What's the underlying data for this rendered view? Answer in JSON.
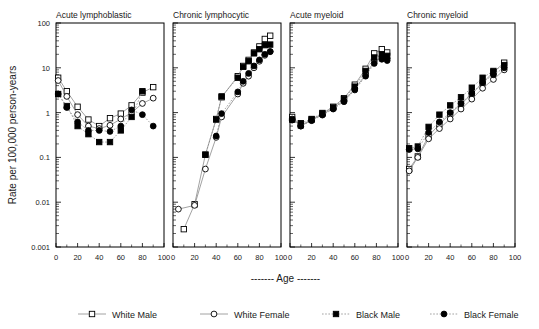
{
  "figure": {
    "ylabel": "Rate per 100,000 person-years",
    "xlabel": "Age",
    "xlabel_prefix": "-------",
    "xlabel_suffix": "-------"
  },
  "legend": {
    "items": [
      {
        "label": "White Male",
        "marker": "open-square",
        "line": "solid",
        "color": "#000000"
      },
      {
        "label": "White Female",
        "marker": "open-circle",
        "line": "solid",
        "color": "#000000"
      },
      {
        "label": "Black Male",
        "marker": "filled-square",
        "line": "dotted",
        "color": "#000000"
      },
      {
        "label": "Black Female",
        "marker": "filled-circle",
        "line": "dotted",
        "color": "#000000"
      }
    ]
  },
  "axes": {
    "y_ticks": [
      "100",
      "10",
      "1",
      "0.1",
      "0.01",
      "0.001"
    ],
    "y_values": [
      100,
      10,
      1,
      0.1,
      0.01,
      0.001
    ],
    "x_ticks": [
      "0",
      "20",
      "40",
      "60",
      "80",
      "100"
    ],
    "x_values": [
      0,
      20,
      40,
      60,
      80,
      100
    ],
    "ylim": [
      0.001,
      100
    ],
    "xlim": [
      0,
      100
    ],
    "yscale": "log"
  },
  "chart_data": [
    {
      "type": "line",
      "title": "Acute lymphoblastic",
      "xlabel": "Age",
      "ylabel": "Rate per 100,000 person-years",
      "yscale": "log",
      "ylim": [
        0.001,
        100
      ],
      "xlim": [
        0,
        100
      ],
      "x": [
        2,
        10,
        20,
        30,
        40,
        50,
        60,
        70,
        80,
        90
      ],
      "series": [
        {
          "name": "White Male",
          "marker": "open-square",
          "line": "solid",
          "values": [
            6.0,
            3.0,
            1.35,
            0.7,
            0.5,
            0.75,
            0.95,
            1.45,
            2.8,
            3.7
          ]
        },
        {
          "name": "White Female",
          "marker": "open-circle",
          "line": "solid",
          "values": [
            5.2,
            2.3,
            0.9,
            0.5,
            0.44,
            0.52,
            0.72,
            1.0,
            1.6,
            2.1
          ]
        },
        {
          "name": "Black Male",
          "marker": "filled-square",
          "line": "dotted",
          "values": [
            2.6,
            1.4,
            0.5,
            0.33,
            0.22,
            0.22,
            0.4,
            0.8,
            3.0,
            null
          ]
        },
        {
          "name": "Black Female",
          "marker": "filled-circle",
          "line": "dotted",
          "values": [
            2.6,
            1.3,
            0.62,
            0.4,
            0.4,
            0.38,
            0.5,
            1.15,
            0.9,
            0.5
          ]
        }
      ]
    },
    {
      "type": "line",
      "title": "Chronic lymphocytic",
      "xlabel": "Age",
      "ylabel": "Rate per 100,000 person-years",
      "yscale": "log",
      "ylim": [
        0.001,
        100
      ],
      "xlim": [
        0,
        100
      ],
      "x": [
        5,
        10,
        20,
        30,
        40,
        45,
        50,
        60,
        65,
        70,
        75,
        80,
        85,
        90
      ],
      "series": [
        {
          "name": "White Male",
          "marker": "open-square",
          "line": "solid",
          "values": [
            null,
            0.0025,
            0.009,
            0.115,
            0.72,
            2.2,
            null,
            6.5,
            11.0,
            15.0,
            22.0,
            30.0,
            44.0,
            52.0
          ]
        },
        {
          "name": "White Female",
          "marker": "open-circle",
          "line": "solid",
          "values": [
            0.007,
            null,
            0.0085,
            0.055,
            0.28,
            0.8,
            null,
            2.6,
            4.5,
            6.5,
            10.0,
            14.0,
            19.0,
            23.0
          ]
        },
        {
          "name": "Black Male",
          "marker": "filled-square",
          "line": "dotted",
          "values": [
            null,
            null,
            null,
            0.115,
            0.7,
            2.3,
            null,
            6.0,
            10.5,
            14.0,
            21.0,
            26.0,
            32.0,
            33.0
          ]
        },
        {
          "name": "Black Female",
          "marker": "filled-circle",
          "line": "dotted",
          "values": [
            null,
            null,
            null,
            null,
            0.3,
            0.95,
            null,
            2.9,
            5.0,
            7.5,
            11.0,
            15.0,
            20.0,
            23.0
          ]
        }
      ]
    },
    {
      "type": "line",
      "title": "Acute myeloid",
      "xlabel": "Age",
      "ylabel": "Rate per 100,000 person-years",
      "yscale": "log",
      "ylim": [
        0.001,
        100
      ],
      "xlim": [
        0,
        100
      ],
      "x": [
        2,
        10,
        20,
        30,
        40,
        50,
        60,
        70,
        78,
        85,
        90
      ],
      "series": [
        {
          "name": "White Male",
          "marker": "open-square",
          "line": "solid",
          "values": [
            0.8,
            0.52,
            0.7,
            0.95,
            1.35,
            2.1,
            4.2,
            9.5,
            21.0,
            26.0,
            22.0
          ]
        },
        {
          "name": "White Female",
          "marker": "open-circle",
          "line": "solid",
          "values": [
            0.72,
            0.5,
            0.68,
            0.9,
            1.25,
            1.85,
            3.4,
            7.0,
            14.0,
            17.5,
            16.0
          ]
        },
        {
          "name": "Black Male",
          "marker": "filled-square",
          "line": "dotted",
          "values": [
            0.7,
            0.58,
            0.72,
            0.98,
            1.3,
            2.0,
            3.8,
            8.5,
            17.0,
            20.0,
            18.5
          ]
        },
        {
          "name": "Black Female",
          "marker": "filled-circle",
          "line": "dotted",
          "values": [
            0.68,
            0.5,
            0.66,
            0.88,
            1.2,
            1.75,
            3.2,
            6.5,
            12.5,
            15.5,
            14.5
          ]
        }
      ]
    },
    {
      "type": "line",
      "title": "Chronic myeloid",
      "xlabel": "Age",
      "ylabel": "Rate per 100,000 person-years",
      "yscale": "log",
      "ylim": [
        0.001,
        100
      ],
      "xlim": [
        0,
        100
      ],
      "x": [
        2,
        10,
        20,
        30,
        40,
        50,
        60,
        70,
        80,
        90
      ],
      "series": [
        {
          "name": "White Male",
          "marker": "open-square",
          "line": "solid",
          "values": [
            0.055,
            0.105,
            0.3,
            0.55,
            0.95,
            1.55,
            2.6,
            4.6,
            8.0,
            13.0
          ]
        },
        {
          "name": "White Female",
          "marker": "open-circle",
          "line": "solid",
          "values": [
            0.05,
            0.1,
            0.26,
            0.44,
            0.72,
            1.2,
            2.0,
            3.5,
            5.5,
            9.0
          ]
        },
        {
          "name": "Black Male",
          "marker": "filled-square",
          "line": "dotted",
          "values": [
            0.16,
            0.175,
            0.48,
            0.9,
            1.45,
            2.2,
            3.6,
            6.0,
            8.5,
            11.5
          ]
        },
        {
          "name": "Black Female",
          "marker": "filled-circle",
          "line": "dotted",
          "values": [
            0.15,
            0.155,
            0.36,
            0.62,
            1.0,
            1.6,
            2.7,
            4.7,
            7.0,
            10.0
          ]
        }
      ]
    }
  ]
}
